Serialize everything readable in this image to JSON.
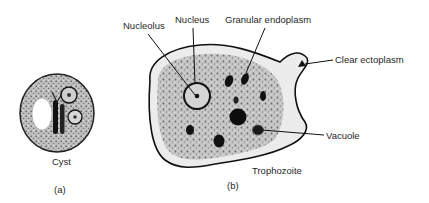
{
  "figure": {
    "panel_a": {
      "caption": "(a)",
      "title": "Cyst"
    },
    "panel_b": {
      "caption": "(b)",
      "title": "Trophozoite",
      "labels": {
        "nucleolus": "Nucleolus",
        "nucleus": "Nucleus",
        "granular_endoplasm": "Granular endoplasm",
        "clear_ectoplasm": "Clear ectoplasm",
        "vacuole": "Vacuole"
      }
    },
    "colors": {
      "outline": "#111111",
      "cytoplasm": "#b8b8b8",
      "ectoplasm": "#e6e6e6",
      "background": "#ffffff"
    }
  }
}
